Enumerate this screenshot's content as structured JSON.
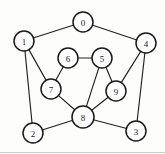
{
  "figure": {
    "title": "",
    "background_color": "#fdfdfc",
    "node_fill": "#ffffff",
    "node_stroke": "#1a1a1a",
    "edge_color": "#231f20",
    "width": 165,
    "height": 154
  },
  "chart_data": {
    "type": "diagram",
    "diagram_type": "undirected-graph",
    "title": "",
    "xlabel": "",
    "ylabel": "",
    "node_count": 10,
    "edge_count": 15,
    "nodes": [
      {
        "id": "0",
        "label": "0",
        "x": 83,
        "y": 22,
        "r": 10
      },
      {
        "id": "1",
        "label": "1",
        "x": 24,
        "y": 41,
        "r": 10
      },
      {
        "id": "2",
        "label": "2",
        "x": 33,
        "y": 133,
        "r": 10
      },
      {
        "id": "3",
        "label": "3",
        "x": 136,
        "y": 131,
        "r": 10
      },
      {
        "id": "4",
        "label": "4",
        "x": 146,
        "y": 43,
        "r": 10
      },
      {
        "id": "5",
        "label": "5",
        "x": 102,
        "y": 58,
        "r": 10
      },
      {
        "id": "6",
        "label": "6",
        "x": 68,
        "y": 58,
        "r": 10
      },
      {
        "id": "7",
        "label": "7",
        "x": 51,
        "y": 89,
        "r": 10
      },
      {
        "id": "8",
        "label": "8",
        "x": 83,
        "y": 117,
        "r": 11
      },
      {
        "id": "9",
        "label": "9",
        "x": 116,
        "y": 91,
        "r": 10
      }
    ],
    "edges": [
      {
        "source": "0",
        "target": "1"
      },
      {
        "source": "0",
        "target": "4"
      },
      {
        "source": "1",
        "target": "2"
      },
      {
        "source": "1",
        "target": "7"
      },
      {
        "source": "2",
        "target": "8"
      },
      {
        "source": "3",
        "target": "4"
      },
      {
        "source": "3",
        "target": "8"
      },
      {
        "source": "4",
        "target": "9"
      },
      {
        "source": "5",
        "target": "6"
      },
      {
        "source": "5",
        "target": "8"
      },
      {
        "source": "5",
        "target": "9"
      },
      {
        "source": "6",
        "target": "7"
      },
      {
        "source": "7",
        "target": "8"
      },
      {
        "source": "8",
        "target": "9"
      },
      {
        "source": "4",
        "target": "3"
      }
    ],
    "legend": [],
    "annotations": []
  }
}
